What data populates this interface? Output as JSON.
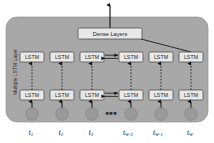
{
  "diagram": {
    "container": {
      "fill": "#a8a8a8",
      "stroke": "#8f8f8f",
      "x": 6,
      "y": 17,
      "width": 202,
      "height": 105,
      "radius": 11
    },
    "side_label": {
      "text": "Multiple LSTM Layer",
      "rotation": -90
    },
    "dense": {
      "label": "Dense Layers",
      "fill": "#e8e8e8",
      "stroke": "#4a4a4a",
      "x": 78,
      "y": 28,
      "width": 64,
      "height": 11
    },
    "lstm_label": "LSTM",
    "lstm_box": {
      "fill": "#e8e8e8",
      "stroke": "#4a4a4a",
      "width": 24,
      "height": 10
    },
    "rows": [
      {
        "name": "top-lstm-row",
        "y": 52,
        "cells": [
          "LSTM",
          "LSTM",
          "LSTM",
          "LSTM",
          "LSTM",
          "LSTM"
        ]
      },
      {
        "name": "bottom-lstm-row",
        "y": 90,
        "cells": [
          "LSTM",
          "LSTM",
          "LSTM",
          "LSTM",
          "LSTM",
          "LSTM"
        ]
      }
    ],
    "columns_x": [
      32,
      62,
      92,
      131,
      161,
      191
    ],
    "inputs": {
      "circle_fill": "#9a9a9a",
      "circle_stroke": "#7c7c7c",
      "radius": 6.2,
      "cy": 114,
      "nodes": [
        {
          "base": "t",
          "sub": "1",
          "x": 32
        },
        {
          "base": "t",
          "sub": "2",
          "x": 62
        },
        {
          "base": "t",
          "sub": "3",
          "x": 92
        },
        {
          "base": "t",
          "sub": "W-2",
          "x": 131
        },
        {
          "base": "t",
          "sub": "W-1",
          "x": 161
        },
        {
          "base": "t",
          "sub": "W",
          "x": 191
        }
      ],
      "label_y": 132
    },
    "ellipsis": {
      "text": "•••",
      "x": 111,
      "y": 113
    },
    "output_arrow": {
      "name": "output-arrow",
      "from_y": 28,
      "to_y": 4,
      "x": 110
    },
    "colors": {
      "background": "#ffffff",
      "panel": "#a8a8a8",
      "box": "#e8e8e8",
      "line": "#1f1f1f",
      "node": "#9a9a9a"
    }
  }
}
